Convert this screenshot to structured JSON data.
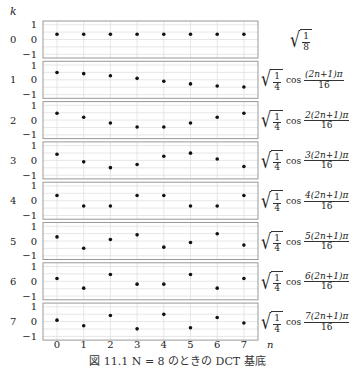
{
  "chart_data": {
    "type": "scatter",
    "title": "",
    "xlabel": "n",
    "ylabel": "k",
    "x": [
      0,
      1,
      2,
      3,
      4,
      5,
      6,
      7
    ],
    "ylim": [
      -1.25,
      1.25
    ],
    "yticks": [
      1,
      0,
      -1
    ],
    "grid": true,
    "series": [
      {
        "name": "k=0",
        "k": 0,
        "formula": "sqrt(1/8)",
        "values": [
          0.354,
          0.354,
          0.354,
          0.354,
          0.354,
          0.354,
          0.354,
          0.354
        ]
      },
      {
        "name": "k=1",
        "k": 1,
        "formula": "sqrt(1/4) cos((2n+1)π/16)",
        "values": [
          0.49,
          0.416,
          0.278,
          0.098,
          -0.098,
          -0.278,
          -0.416,
          -0.49
        ]
      },
      {
        "name": "k=2",
        "k": 2,
        "formula": "sqrt(1/4) cos(2(2n+1)π/16)",
        "values": [
          0.462,
          0.191,
          -0.191,
          -0.462,
          -0.462,
          -0.191,
          0.191,
          0.462
        ]
      },
      {
        "name": "k=3",
        "k": 3,
        "formula": "sqrt(1/4) cos(3(2n+1)π/16)",
        "values": [
          0.416,
          -0.098,
          -0.49,
          -0.278,
          0.278,
          0.49,
          0.098,
          -0.416
        ]
      },
      {
        "name": "k=4",
        "k": 4,
        "formula": "sqrt(1/4) cos(4(2n+1)π/16)",
        "values": [
          0.354,
          -0.354,
          -0.354,
          0.354,
          0.354,
          -0.354,
          -0.354,
          0.354
        ]
      },
      {
        "name": "k=5",
        "k": 5,
        "formula": "sqrt(1/4) cos(5(2n+1)π/16)",
        "values": [
          0.278,
          -0.49,
          0.098,
          0.416,
          -0.416,
          -0.098,
          0.49,
          -0.278
        ]
      },
      {
        "name": "k=6",
        "k": 6,
        "formula": "sqrt(1/4) cos(6(2n+1)π/16)",
        "values": [
          0.191,
          -0.462,
          0.462,
          -0.191,
          -0.191,
          0.462,
          -0.462,
          0.191
        ]
      },
      {
        "name": "k=7",
        "k": 7,
        "formula": "sqrt(1/4) cos(7(2n+1)π/16)",
        "values": [
          0.098,
          -0.278,
          0.416,
          -0.49,
          0.49,
          -0.416,
          0.278,
          -0.098
        ]
      }
    ]
  },
  "labels": {
    "k_axis": "k",
    "n_axis": "n",
    "caption": "図 11.1  N = 8 のときの DCT 基底"
  },
  "formulas": {
    "k0": {
      "num": "1",
      "den": "8"
    },
    "common": {
      "sqrt_num": "1",
      "sqrt_den": "4",
      "cos": "cos",
      "den": "16"
    },
    "nums": [
      "",
      "(2n+1)π",
      "2(2n+1)π",
      "3(2n+1)π",
      "4(2n+1)π",
      "5(2n+1)π",
      "6(2n+1)π",
      "7(2n+1)π"
    ]
  },
  "colors": {
    "frame": "#999999",
    "grid": "#dddddd",
    "point": "#111111",
    "text": "#222222"
  }
}
